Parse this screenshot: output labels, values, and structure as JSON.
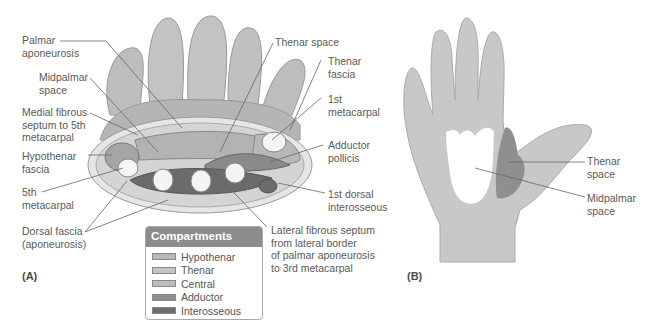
{
  "panels": {
    "a": {
      "label": "(A)",
      "left_labels": [
        {
          "id": "palmar-aponeurosis",
          "text": "Palmar\naponeurosis"
        },
        {
          "id": "midpalmar-space",
          "text": "Midpalmar\nspace"
        },
        {
          "id": "medial-fibrous-septum",
          "text": "Medial fibrous\nseptum to 5th\nmetacarpal"
        },
        {
          "id": "hypothenar-fascia",
          "text": "Hypothenar\nfascia"
        },
        {
          "id": "fifth-metacarpal",
          "text": "5th\nmetacarpal"
        },
        {
          "id": "dorsal-fascia",
          "text": "Dorsal fascia\n(aponeurosis)"
        }
      ],
      "right_labels": [
        {
          "id": "thenar-space",
          "text": "Thenar space"
        },
        {
          "id": "thenar-fascia",
          "text": "Thenar\nfascia"
        },
        {
          "id": "first-metacarpal",
          "text": "1st\nmetacarpal"
        },
        {
          "id": "adductor-pollicis",
          "text": "Adductor\npollicis"
        },
        {
          "id": "first-dorsal-interosseous",
          "text": "1st dorsal\ninterosseous"
        },
        {
          "id": "lateral-fibrous-septum",
          "text": "Lateral fibrous septum\nfrom lateral border\nof palmar aponeurosis\nto 3rd metacarpal"
        }
      ],
      "legend": {
        "title": "Compartments",
        "items": [
          {
            "label": "Hypothenar",
            "color": "#b8b8b8"
          },
          {
            "label": "Thenar",
            "color": "#c4c4c4"
          },
          {
            "label": "Central",
            "color": "#bdbdbd"
          },
          {
            "label": "Adductor",
            "color": "#8e8e8e"
          },
          {
            "label": "Interosseous",
            "color": "#6e6e6e"
          }
        ]
      }
    },
    "b": {
      "label": "(B)",
      "labels": [
        {
          "id": "thenar-space-b",
          "text": "Thenar\nspace"
        },
        {
          "id": "midpalmar-space-b",
          "text": "Midpalmar\nspace"
        }
      ]
    }
  },
  "colors": {
    "hand_fill": "#c8c8c8",
    "thenar_space_fill": "#8f8f8f",
    "midpalmar_space_fill": "#ffffff",
    "legend_header": "#8c8c8c"
  }
}
